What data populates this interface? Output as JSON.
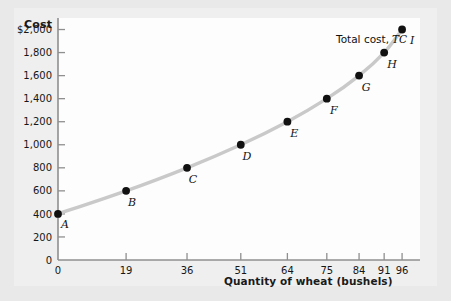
{
  "chart_data": {
    "type": "line",
    "title": "",
    "ylabel": "Cost",
    "xlabel": "Quantity of wheat (bushels)",
    "series_label_prefix": "Total cost,",
    "series_label_symbol": "TC",
    "x": [
      0,
      19,
      36,
      51,
      64,
      75,
      84,
      91,
      96
    ],
    "values": [
      400,
      600,
      800,
      1000,
      1200,
      1400,
      1600,
      1800,
      2000
    ],
    "point_labels": [
      "A",
      "B",
      "C",
      "D",
      "E",
      "F",
      "G",
      "H",
      "I"
    ],
    "xticks": [
      "0",
      "19",
      "36",
      "51",
      "64",
      "75",
      "84",
      "91",
      "96"
    ],
    "yticks": [
      "0",
      "200",
      "400",
      "600",
      "800",
      "1,000",
      "1,200",
      "1,400",
      "1,600",
      "1,800",
      "$2,000"
    ],
    "ytick_values": [
      0,
      200,
      400,
      600,
      800,
      1000,
      1200,
      1400,
      1600,
      1800,
      2000
    ],
    "xlim": [
      0,
      101
    ],
    "ylim": [
      0,
      2100
    ],
    "grid": false,
    "legend_position": "inside-top-right",
    "colors": {
      "curve": "#c9c9c9",
      "point": "#111111",
      "axis": "#8f8f8f",
      "text": "#161616",
      "background": "#e9e9e9",
      "plot_background": "#fdfdfd"
    }
  }
}
